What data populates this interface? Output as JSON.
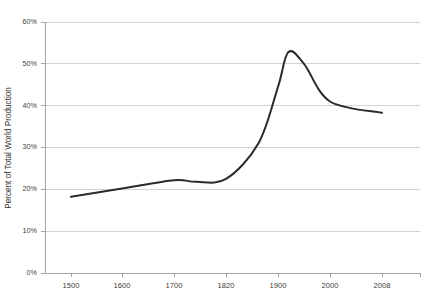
{
  "chart_data": {
    "type": "line",
    "title": "",
    "xlabel": "",
    "ylabel": "Percent of Total World Production",
    "ylim": [
      0,
      60
    ],
    "xlim": [
      1500,
      2008
    ],
    "grid": "horizontal",
    "legend": "none",
    "y_tick_labels": [
      "0%",
      "10%",
      "20%",
      "30%",
      "40%",
      "50%",
      "60%"
    ],
    "y_tick_values": [
      0,
      10,
      20,
      30,
      40,
      50,
      60
    ],
    "x_tick_labels": [
      "1500",
      "1600",
      "1700",
      "1820",
      "1900",
      "2000",
      "2008"
    ],
    "x_tick_values": [
      1500,
      1600,
      1700,
      1820,
      1900,
      2000,
      2008
    ],
    "series": [
      {
        "name": "Percent of Total World Production",
        "color": "#2b2b2b",
        "x": [
          1500,
          1600,
          1700,
          1750,
          1820,
          1870,
          1900,
          1920,
          1950,
          2000,
          2008
        ],
        "values": [
          18.2,
          20.2,
          22.2,
          21.8,
          22.5,
          31.0,
          44.5,
          52.8,
          50.0,
          41.0,
          38.3
        ]
      }
    ]
  },
  "axis": {
    "y_label": "Percent of Total World Production",
    "y_ticks": [
      {
        "label": "60%",
        "value": 60
      },
      {
        "label": "50%",
        "value": 50
      },
      {
        "label": "40%",
        "value": 40
      },
      {
        "label": "30%",
        "value": 30
      },
      {
        "label": "20%",
        "value": 20
      },
      {
        "label": "10%",
        "value": 10
      },
      {
        "label": "0%",
        "value": 0
      }
    ],
    "x_ticks": [
      {
        "label": "1500",
        "value": 1500
      },
      {
        "label": "1600",
        "value": 1600
      },
      {
        "label": "1700",
        "value": 1700
      },
      {
        "label": "1820",
        "value": 1820
      },
      {
        "label": "1900",
        "value": 1900
      },
      {
        "label": "2000",
        "value": 2000
      },
      {
        "label": "2008",
        "value": 2008
      }
    ]
  },
  "colors": {
    "series": "#2b2b2b",
    "grid": "#c8c8c8",
    "axis": "#9a9a9a",
    "text": "#3d3d3d",
    "background": "#ffffff"
  }
}
